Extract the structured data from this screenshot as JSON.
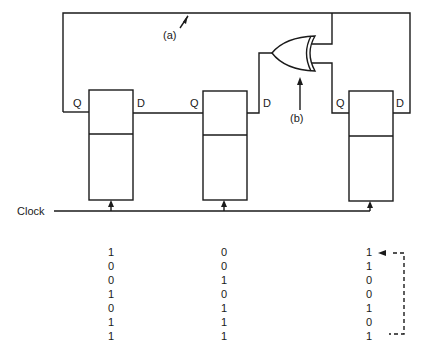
{
  "diagram": {
    "labels": {
      "a": "(a)",
      "b": "(b)",
      "clock": "Clock",
      "q": "Q",
      "d": "D"
    },
    "flip_flops": [
      {
        "id": "ff1",
        "q": "Q",
        "d": "D"
      },
      {
        "id": "ff2",
        "q": "Q",
        "d": "D"
      },
      {
        "id": "ff3",
        "q": "Q",
        "d": "D"
      }
    ],
    "gate": {
      "type": "XOR",
      "label": "(b)"
    },
    "feedback_line_label": "(a)"
  },
  "state_table": {
    "columns": [
      [
        "1",
        "0",
        "0",
        "1",
        "0",
        "1",
        "1"
      ],
      [
        "0",
        "0",
        "1",
        "0",
        "1",
        "1",
        "1"
      ],
      [
        "1",
        "1",
        "0",
        "0",
        "1",
        "0",
        "1"
      ]
    ],
    "cycle_indicator": "dashed return arrow from last row to first row"
  }
}
